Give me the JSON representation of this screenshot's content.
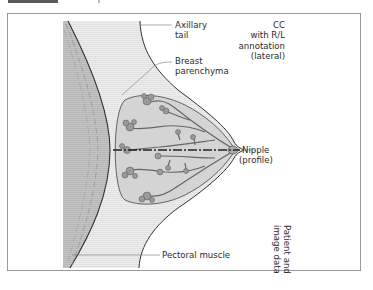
{
  "figure": {
    "type": "schematic",
    "view": "CC mammogram schematic"
  },
  "labels": {
    "axillary_tail": [
      "Axillary",
      "tail"
    ],
    "breast_parenchyma": [
      "Breast",
      "parenchyma"
    ],
    "view_annotation": [
      "CC",
      "with R/L",
      "annotation",
      "(lateral)"
    ],
    "nipple": [
      "Nipple",
      "(profile)"
    ],
    "pectoral_muscle": "Pectoral muscle",
    "patient_data": [
      "Patient and",
      "image data"
    ]
  },
  "colors": {
    "frame_border": "#9a9a9a",
    "pectoral_muscle": "#bdbdbd",
    "image_background": "#e9e9e9",
    "parenchyma_fill": "#d6d6d6",
    "outline": "#333333",
    "leader_line": "#777777"
  }
}
